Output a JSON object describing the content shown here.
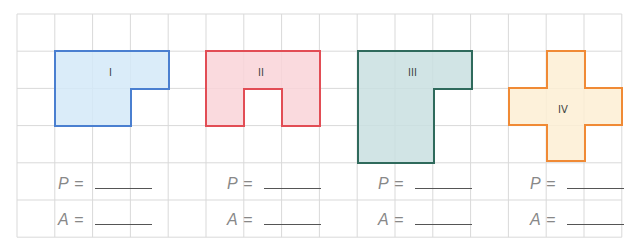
{
  "grid": {
    "left": 17,
    "top": 14,
    "cols": 16,
    "rows": 6,
    "cell_w": 37.8,
    "cell_h": 37.2,
    "line_color": "#d9d9d9"
  },
  "shapes": [
    {
      "id": "I",
      "label": "I",
      "fill": "#d3e9f8",
      "stroke": "#4a7fd0",
      "points": "55,51 169,51 169,89 131,89 131,126 55,126",
      "label_x": 112,
      "label_y": 74
    },
    {
      "id": "II",
      "label": "II",
      "fill": "#f9d3d8",
      "stroke": "#e24d55",
      "points": "206,51 320,51 320,126 282,126 282,89 244,89 244,126 206,126",
      "label_x": 263,
      "label_y": 74
    },
    {
      "id": "III",
      "label": "III",
      "fill": "#c9dfe0",
      "stroke": "#2f6a5c",
      "points": "358,51 472,51 472,89 434,89 434,163 358,163",
      "label_x": 415,
      "label_y": 74
    },
    {
      "id": "IV",
      "label": "IV",
      "fill": "#fdeed3",
      "stroke": "#f08a35",
      "points": "547,51 585,51 585,88 622,88 622,125 585,125 585,161 547,161 547,125 509,125 509,88 547,88",
      "label_x": 566,
      "label_y": 111
    }
  ],
  "formulas": [
    {
      "perimeter_var": "P",
      "area_var": "A",
      "equals": "=",
      "x": 58
    },
    {
      "perimeter_var": "P",
      "area_var": "A",
      "equals": "=",
      "x": 227
    },
    {
      "perimeter_var": "P",
      "area_var": "A",
      "equals": "=",
      "x": 378
    },
    {
      "perimeter_var": "P",
      "area_var": "A",
      "equals": "=",
      "x": 530
    }
  ]
}
